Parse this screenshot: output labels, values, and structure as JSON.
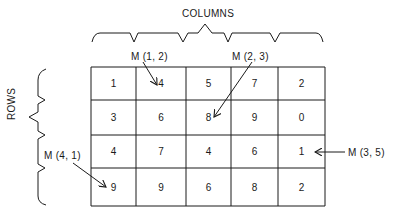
{
  "title_columns": "COLUMNS",
  "title_rows": "ROWS",
  "matrix": [
    [
      "1",
      "4",
      "5",
      "7",
      "2"
    ],
    [
      "3",
      "6",
      "8",
      "9",
      "0"
    ],
    [
      "4",
      "7",
      "4",
      "6",
      "1"
    ],
    [
      "9",
      "9",
      "6",
      "8",
      "2"
    ]
  ],
  "annotations": [
    {
      "label": "M (1, 2)",
      "row": 1,
      "col": 2
    },
    {
      "label": "M (2, 3)",
      "row": 2,
      "col": 3
    },
    {
      "label": "M (4, 1)",
      "row": 4,
      "col": 1
    },
    {
      "label": "M (3, 5)",
      "row": 3,
      "col": 5
    }
  ],
  "colors": {
    "ink": "#1a1a1a",
    "background": "#ffffff"
  }
}
